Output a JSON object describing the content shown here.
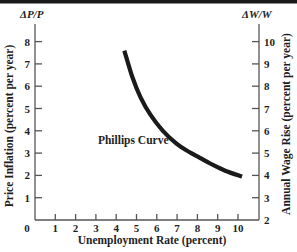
{
  "chart_data": {
    "type": "line",
    "title": "",
    "xlabel": "Unemployment Rate (percent)",
    "ylabel": "Price Inflation (percent per year)",
    "ylabel_right": "Annual Wage Rise (percent per year)",
    "corner_label_left": "ΔP/P",
    "corner_label_right": "ΔW/W",
    "xlim": [
      0,
      10.8
    ],
    "ylim": [
      0,
      8.8
    ],
    "ylim_right": [
      2,
      10.8
    ],
    "x_ticks": [
      0,
      1,
      2,
      3,
      4,
      5,
      6,
      7,
      8,
      9,
      10
    ],
    "y_ticks": [
      1,
      2,
      3,
      4,
      5,
      6,
      7,
      8
    ],
    "y_ticks_right": [
      2,
      3,
      4,
      5,
      6,
      7,
      8,
      9,
      10
    ],
    "grid": false,
    "legend": null,
    "annotations": [
      {
        "text": "Phillips Curve",
        "x": 3.1,
        "y": 3.4
      }
    ],
    "series": [
      {
        "name": "Phillips Curve",
        "x": [
          4.4,
          4.8,
          5.2,
          5.7,
          6.3,
          7.0,
          7.6,
          8.1,
          8.7,
          9.4,
          10.2
        ],
        "y": [
          7.6,
          6.4,
          5.5,
          4.7,
          4.0,
          3.4,
          3.05,
          2.8,
          2.5,
          2.2,
          1.95
        ],
        "y_right_equivalent": [
          9.6,
          8.4,
          7.5,
          6.7,
          6.0,
          5.4,
          5.05,
          4.8,
          4.5,
          4.2,
          3.95
        ]
      }
    ]
  },
  "colors": {
    "ink": "#1e1e1e",
    "axis": "#555555",
    "curve": "#1a1a1a",
    "header_bar": "#1a1a1a"
  }
}
